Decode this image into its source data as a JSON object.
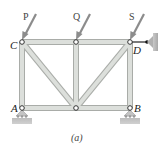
{
  "figure": {
    "caption": "(a)",
    "type": "truss"
  },
  "joints": {
    "C": {
      "label": "C"
    },
    "D": {
      "label": "D"
    },
    "A": {
      "label": "A"
    },
    "B": {
      "label": "B"
    }
  },
  "loads": [
    {
      "label": "P",
      "joint": "C"
    },
    {
      "label": "Q",
      "joint": "top-middle"
    },
    {
      "label": "S",
      "joint": "D"
    }
  ],
  "colors": {
    "member_fill": "#d9dcd8",
    "member_edge": "#a9aca8",
    "arrow": "#8c8c8c",
    "ground": "#b5b5b5"
  }
}
